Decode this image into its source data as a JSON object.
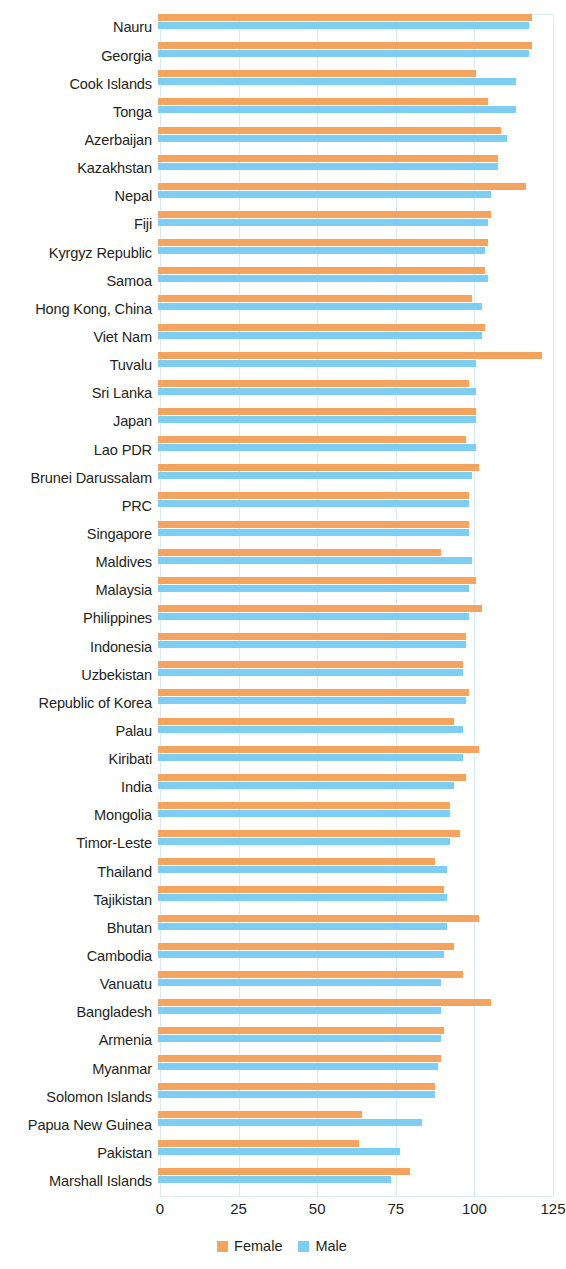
{
  "chart_data": {
    "type": "bar",
    "orientation": "horizontal",
    "title": "",
    "subtitle": "",
    "xlabel": "",
    "ylabel": "",
    "xlim": [
      0,
      125
    ],
    "xticks": [
      0,
      25,
      50,
      75,
      100,
      125
    ],
    "xtick_labels": [
      "0",
      "25",
      "50",
      "75",
      "100",
      "125"
    ],
    "grid": true,
    "grid_axis": "x",
    "legend_position": "bottom-center",
    "colors": {
      "female": "#f5a460",
      "male": "#7ecdf2",
      "grid": "#d9ecf5",
      "text": "#231f20"
    },
    "legend": [
      {
        "name": "Female",
        "color": "#f5a460"
      },
      {
        "name": "Male",
        "color": "#7ecdf2"
      }
    ],
    "categories": [
      "Nauru",
      "Georgia",
      "Cook Islands",
      "Tonga",
      "Azerbaijan",
      "Kazakhstan",
      "Nepal",
      "Fiji",
      "Kyrgyz Republic",
      "Samoa",
      "Hong Kong, China",
      "Viet Nam",
      "Tuvalu",
      "Sri Lanka",
      "Japan",
      "Lao PDR",
      "Brunei Darussalam",
      "PRC",
      "Singapore",
      "Maldives",
      "Malaysia",
      "Philippines",
      "Indonesia",
      "Uzbekistan",
      "Republic of Korea",
      "Palau",
      "Kiribati",
      "India",
      "Mongolia",
      "Timor-Leste",
      "Thailand",
      "Tajikistan",
      "Bhutan",
      "Cambodia",
      "Vanuatu",
      "Bangladesh",
      "Armenia",
      "Myanmar",
      "Solomon Islands",
      "Papua New Guinea",
      "Pakistan",
      "Marshall Islands"
    ],
    "series": [
      {
        "name": "Female",
        "color": "#f5a460",
        "values": [
          119,
          119,
          101,
          105,
          109,
          108,
          117,
          106,
          105,
          104,
          100,
          104,
          122,
          99,
          101,
          98,
          102,
          99,
          99,
          90,
          101,
          103,
          98,
          97,
          99,
          94,
          102,
          98,
          93,
          96,
          88,
          91,
          102,
          94,
          97,
          106,
          91,
          90,
          88,
          65,
          64,
          80
        ]
      },
      {
        "name": "Male",
        "color": "#7ecdf2",
        "values": [
          118,
          118,
          114,
          114,
          111,
          108,
          106,
          105,
          104,
          105,
          103,
          103,
          101,
          101,
          101,
          101,
          100,
          99,
          99,
          100,
          99,
          99,
          98,
          97,
          98,
          97,
          97,
          94,
          93,
          93,
          92,
          92,
          92,
          91,
          90,
          90,
          90,
          89,
          88,
          84,
          77,
          74
        ]
      }
    ]
  }
}
